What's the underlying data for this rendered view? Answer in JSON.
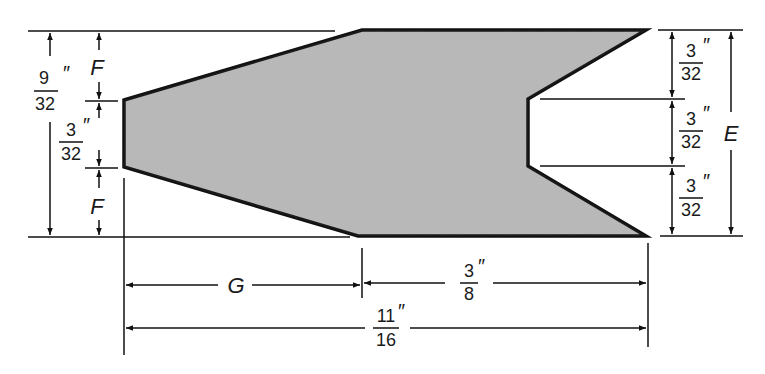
{
  "diagram": {
    "type": "dimensioned-part-drawing",
    "colors": {
      "fill": "#b8b8b8",
      "stroke": "#111111",
      "background": "#ffffff"
    },
    "shape": {
      "outline_points": [
        [
          124,
          100
        ],
        [
          362,
          30
        ],
        [
          646,
          30
        ],
        [
          528,
          99
        ],
        [
          528,
          166
        ],
        [
          646,
          236
        ],
        [
          358,
          236
        ],
        [
          124,
          167
        ]
      ]
    },
    "dimensions": {
      "left_total": {
        "num": "9",
        "den": "32",
        "unit": "″"
      },
      "left_middle": {
        "num": "3",
        "den": "32",
        "unit": "″"
      },
      "left_top_var": "F",
      "left_bottom_var": "F",
      "right_top": {
        "num": "3",
        "den": "32",
        "unit": "″"
      },
      "right_middle": {
        "num": "3",
        "den": "32",
        "unit": "″"
      },
      "right_bottom": {
        "num": "3",
        "den": "32",
        "unit": "″"
      },
      "right_total_var": "E",
      "bottom_left_var": "G",
      "bottom_right": {
        "num": "3",
        "den": "8",
        "unit": "″"
      },
      "bottom_total": {
        "num": "11",
        "den": "16",
        "unit": "″"
      }
    }
  }
}
